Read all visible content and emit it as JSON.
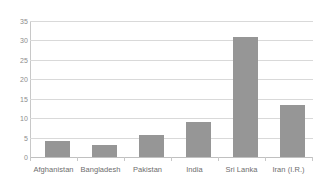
{
  "chart_data": {
    "type": "bar",
    "title": "",
    "subtitle": "",
    "xlabel": "",
    "ylabel": "",
    "categories": [
      "Afghanistan",
      "Bangladesh",
      "Pakistan",
      "India",
      "Sri Lanka",
      "Iran (I.R.)"
    ],
    "values": [
      4.0,
      3.0,
      5.7,
      9.0,
      31.0,
      13.5
    ],
    "ylim": [
      0,
      35
    ],
    "yticks": [
      0,
      5,
      10,
      15,
      20,
      25,
      30,
      35
    ],
    "ytick_labels": [
      "0",
      "5",
      "10",
      "15",
      "20",
      "25",
      "30",
      "35"
    ],
    "grid": true,
    "grid_axis": "y",
    "legend": false,
    "legend_position": "none",
    "bar_color": "#969696",
    "gridline_color": "#d9d9d9",
    "axis_color": "#c8c8c8",
    "background_color": "#ffffff",
    "text_color": "#6e6e6e"
  }
}
